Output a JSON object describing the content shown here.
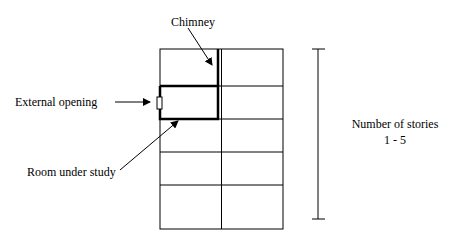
{
  "diagram": {
    "labels": {
      "chimney": "Chimney",
      "external_opening": "External opening",
      "room_under_study": "Room under study",
      "stories_title": "Number of stories",
      "stories_range": "1 - 5"
    },
    "grid": {
      "columns": 2,
      "rows": 5
    },
    "colors": {
      "line": "#000000",
      "background": "#ffffff"
    }
  }
}
